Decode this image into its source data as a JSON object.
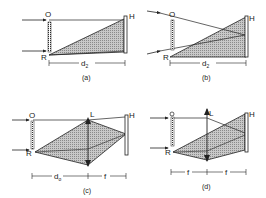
{
  "figure": {
    "panels": [
      {
        "id": "a",
        "caption": "(a)",
        "labels": {
          "object": "O",
          "reference": "R",
          "hologram": "H"
        },
        "dimensions": [
          {
            "label": "d",
            "sub": "2"
          }
        ]
      },
      {
        "id": "b",
        "caption": "(b)",
        "labels": {
          "object": "O",
          "reference": "R",
          "hologram": "H"
        },
        "dimensions": [
          {
            "label": "d",
            "sub": "2"
          }
        ]
      },
      {
        "id": "c",
        "caption": "(c)",
        "labels": {
          "object": "O",
          "reference": "R",
          "hologram": "H",
          "lens": "L"
        },
        "dimensions": [
          {
            "label": "d",
            "sub": "o"
          },
          {
            "label": "f",
            "sub": ""
          }
        ]
      },
      {
        "id": "d",
        "caption": "(d)",
        "labels": {
          "object": "O",
          "reference": "R",
          "hologram": "H",
          "lens": "L"
        },
        "dimensions": [
          {
            "label": "f",
            "sub": ""
          },
          {
            "label": "f",
            "sub": ""
          }
        ]
      }
    ],
    "colors": {
      "line": "#222222",
      "hatch": "#9a9a9a",
      "background": "#ffffff"
    }
  }
}
